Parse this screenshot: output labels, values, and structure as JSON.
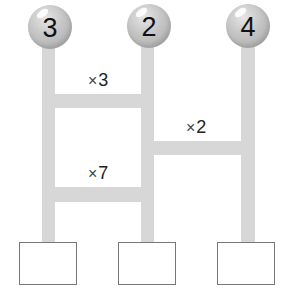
{
  "diagram": {
    "type": "ladder-multiplication",
    "balls": [
      {
        "value": "3"
      },
      {
        "value": "2"
      },
      {
        "value": "4"
      }
    ],
    "rungs": [
      {
        "between": [
          1,
          2
        ],
        "label_symbol": "×",
        "label_value": "3"
      },
      {
        "between": [
          2,
          3
        ],
        "label_symbol": "×",
        "label_value": "2"
      },
      {
        "between": [
          1,
          2
        ],
        "label_symbol": "×",
        "label_value": "7"
      }
    ],
    "answer_boxes": [
      {
        "value": ""
      },
      {
        "value": ""
      },
      {
        "value": ""
      }
    ],
    "colors": {
      "pole": "#d7d7d7",
      "ball": "#c4c4c4",
      "box_border": "#777777"
    }
  }
}
